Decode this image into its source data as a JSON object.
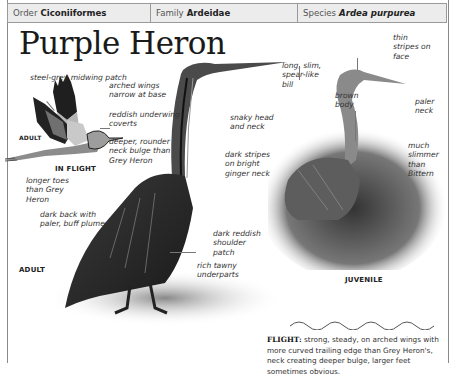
{
  "header": {
    "order_label": "Order",
    "order_value": "Ciconiiformes",
    "family_label": "Family",
    "family_value": "Ardeidae",
    "species_label": "Species",
    "species_value": "Ardea purpurea"
  },
  "title": "Purple Heron",
  "flight_illustration": {
    "caption": "IN FLIGHT",
    "age_label": "ADULT",
    "labels": [
      "steel-grey midwing patch",
      "arched wings narrow at base",
      "reddish underwing coverts",
      "deeper, rounder neck bulge than Grey Heron",
      "longer toes than Grey Heron"
    ]
  },
  "adult_illustration": {
    "age_label": "ADULT",
    "labels": [
      "long, slim, spear-like bill",
      "snaky head and neck",
      "dark stripes on bright ginger neck",
      "dark back with paler, buff plumes",
      "dark reddish shoulder patch",
      "rich tawny underparts"
    ]
  },
  "juvenile_illustration": {
    "caption": "JUVENILE",
    "labels": [
      "thin stripes on face",
      "brown body",
      "paler neck",
      "much slimmer than Bittern"
    ]
  },
  "flight_note": {
    "heading": "FLIGHT:",
    "text": "strong, steady, on arched wings with more curved trailing edge than Grey Heron's, neck creating deeper bulge, larger feet sometimes obvious."
  },
  "colors": {
    "header_bg": "#ececec",
    "border": "#9a9a9a",
    "text": "#333333"
  }
}
